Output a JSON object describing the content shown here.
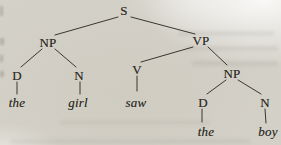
{
  "page": {
    "kind": "scanned-book-figure",
    "background_color": "#d4d1c8",
    "ink_color": "#3a372f"
  },
  "tree": {
    "root_label": "S",
    "sentence": "the girl saw the boy",
    "nodes": [
      {
        "id": "S",
        "label": "S",
        "x": 124,
        "y": 10,
        "style": "roman"
      },
      {
        "id": "NP1",
        "label": "NP",
        "x": 48,
        "y": 42,
        "style": "roman"
      },
      {
        "id": "VP",
        "label": "VP",
        "x": 201,
        "y": 40,
        "style": "roman"
      },
      {
        "id": "D1",
        "label": "D",
        "x": 17,
        "y": 75,
        "style": "roman"
      },
      {
        "id": "N1",
        "label": "N",
        "x": 79,
        "y": 75,
        "style": "roman"
      },
      {
        "id": "V",
        "label": "V",
        "x": 137,
        "y": 69,
        "style": "roman"
      },
      {
        "id": "NP2",
        "label": "NP",
        "x": 232,
        "y": 73,
        "style": "roman"
      },
      {
        "id": "D2",
        "label": "D",
        "x": 203,
        "y": 102,
        "style": "roman"
      },
      {
        "id": "N2",
        "label": "N",
        "x": 265,
        "y": 102,
        "style": "roman"
      },
      {
        "id": "the1",
        "label": "the",
        "x": 17,
        "y": 102,
        "style": "italic"
      },
      {
        "id": "girl",
        "label": "girl",
        "x": 78,
        "y": 102,
        "style": "italic"
      },
      {
        "id": "saw",
        "label": "saw",
        "x": 136,
        "y": 102,
        "style": "italic"
      },
      {
        "id": "the2",
        "label": "the",
        "x": 206,
        "y": 131,
        "style": "italic"
      },
      {
        "id": "boy",
        "label": "boy",
        "x": 268,
        "y": 131,
        "style": "italic"
      }
    ],
    "edges": [
      {
        "from": "S",
        "to": "NP1",
        "x1": 118,
        "y1": 17,
        "x2": 55,
        "y2": 35
      },
      {
        "from": "S",
        "to": "VP",
        "x1": 131,
        "y1": 17,
        "x2": 195,
        "y2": 34
      },
      {
        "from": "NP1",
        "to": "D1",
        "x1": 42,
        "y1": 49,
        "x2": 21,
        "y2": 67
      },
      {
        "from": "NP1",
        "to": "N1",
        "x1": 55,
        "y1": 49,
        "x2": 76,
        "y2": 67
      },
      {
        "from": "VP",
        "to": "V",
        "x1": 193,
        "y1": 47,
        "x2": 141,
        "y2": 62
      },
      {
        "from": "VP",
        "to": "NP2",
        "x1": 208,
        "y1": 47,
        "x2": 227,
        "y2": 65
      },
      {
        "from": "V",
        "to": "saw",
        "x1": 137,
        "y1": 76,
        "x2": 137,
        "y2": 91
      },
      {
        "from": "D1",
        "to": "the1",
        "x1": 17,
        "y1": 82,
        "x2": 17,
        "y2": 94
      },
      {
        "from": "N1",
        "to": "girl",
        "x1": 80,
        "y1": 82,
        "x2": 80,
        "y2": 94
      },
      {
        "from": "NP2",
        "to": "D2",
        "x1": 226,
        "y1": 80,
        "x2": 207,
        "y2": 94
      },
      {
        "from": "NP2",
        "to": "N2",
        "x1": 238,
        "y1": 80,
        "x2": 261,
        "y2": 94
      },
      {
        "from": "D2",
        "to": "the2",
        "x1": 202,
        "y1": 109,
        "x2": 202,
        "y2": 122
      },
      {
        "from": "N2",
        "to": "boy",
        "x1": 265,
        "y1": 109,
        "x2": 266,
        "y2": 123
      }
    ]
  }
}
